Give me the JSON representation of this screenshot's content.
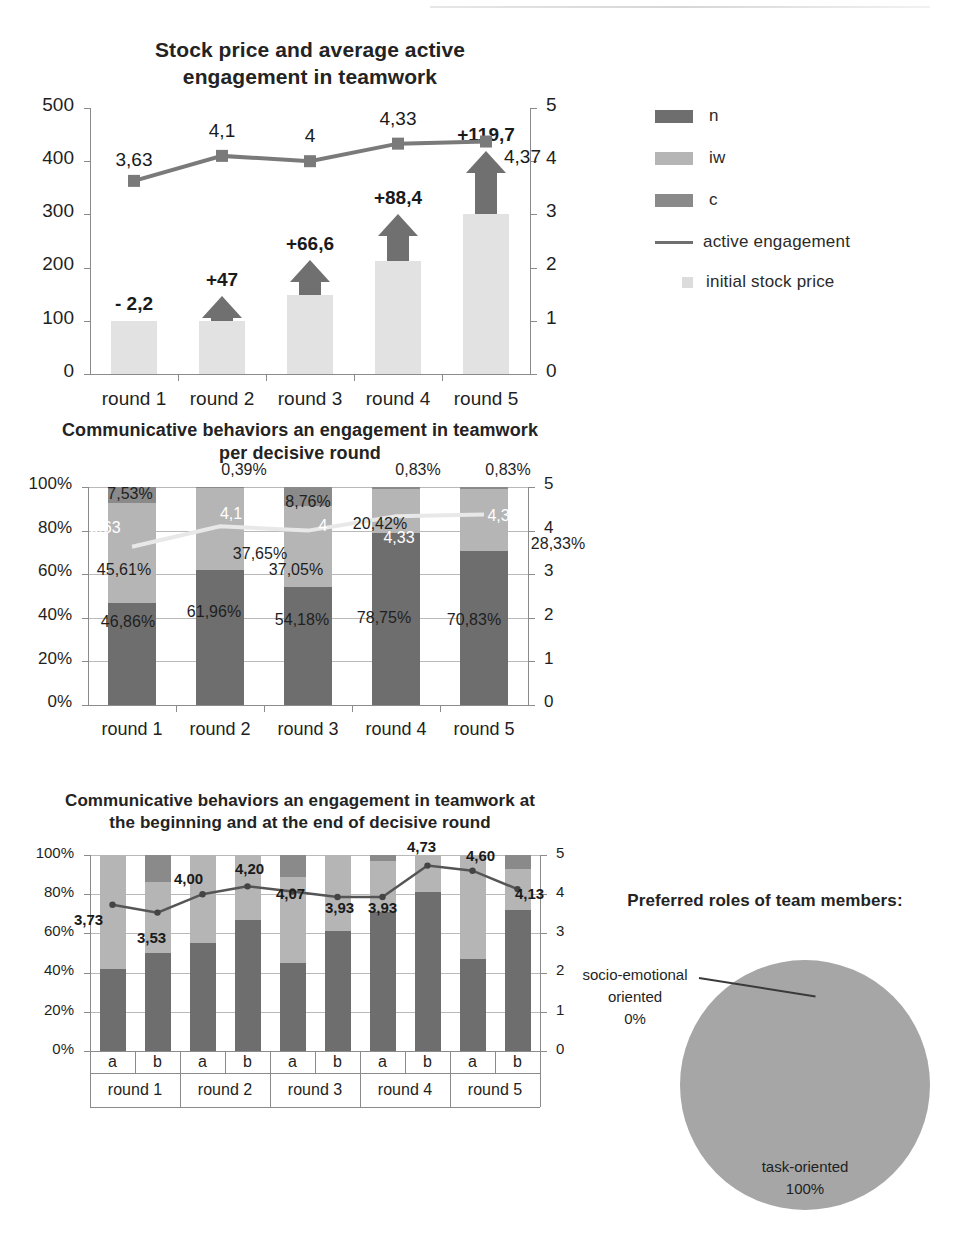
{
  "palette": {
    "dark": "#6e6e6e",
    "mid": "#9a9a9a",
    "light": "#d9d9d9",
    "line": "#7a7a7a",
    "line_light": "#e8e8e8",
    "axis": "#8b8b8b",
    "grid": "#b9b9b9",
    "pie": "#a6a6a6",
    "arrow": "#707070",
    "bar_initial": "#e2e2e2",
    "text": "#1f1f1f"
  },
  "legend": {
    "items": [
      {
        "label": "n",
        "type": "swatch",
        "color": "#6e6e6e"
      },
      {
        "label": "iw",
        "type": "swatch",
        "color": "#b5b5b5"
      },
      {
        "label": "c",
        "type": "swatch",
        "color": "#8a8a8a"
      },
      {
        "label": "active engagement",
        "type": "line",
        "color": "#6f6f6f"
      },
      {
        "label": "initial stock price",
        "type": "square",
        "color": "#dcdcdc"
      }
    ]
  },
  "chart_data": [
    {
      "id": "stock-price-chart",
      "type": "bar",
      "title": "Stock price and average active engagement in teamwork",
      "categories": [
        "round 1",
        "round 2",
        "round 3",
        "round 4",
        "round 5"
      ],
      "ylabel": "",
      "xlabel": "",
      "ylim": [
        0,
        500
      ],
      "yticks": [
        "0",
        "100",
        "200",
        "300",
        "400",
        "500"
      ],
      "y2lim": [
        0,
        5
      ],
      "y2ticks": [
        "0",
        "1",
        "2",
        "3",
        "4",
        "5"
      ],
      "grid": false,
      "legend_position": "right",
      "series": [
        {
          "name": "initial stock price",
          "values": [
            100,
            100,
            148,
            212,
            300
          ]
        },
        {
          "name": "change",
          "labels": [
            "- 2,2",
            "+47",
            "+66,6",
            "+88,4",
            "+119,7"
          ],
          "values": [
            -2.2,
            47,
            66.6,
            88.4,
            119.7
          ]
        },
        {
          "name": "active engagement",
          "values": [
            3.63,
            4.1,
            4.0,
            4.33,
            4.37
          ],
          "labels": [
            "3,63",
            "4,1",
            "4",
            "4,33",
            "4,37"
          ]
        }
      ]
    },
    {
      "id": "communicative-behaviors-per-round-chart",
      "type": "bar",
      "title": "Communicative behaviors an engagement in teamwork per decisive round",
      "categories": [
        "round 1",
        "round 2",
        "round 3",
        "round 4",
        "round 5"
      ],
      "ylim": [
        0,
        100
      ],
      "yticks": [
        "0%",
        "20%",
        "40%",
        "60%",
        "80%",
        "100%"
      ],
      "y2lim": [
        0,
        5
      ],
      "y2ticks": [
        "0",
        "1",
        "2",
        "3",
        "4",
        "5"
      ],
      "grid": true,
      "stacked": true,
      "series": [
        {
          "name": "n",
          "values": [
            46.86,
            61.96,
            54.18,
            78.75,
            70.83
          ],
          "labels": [
            "46,86%",
            "61,96%",
            "54,18%",
            "78,75%",
            "70,83%"
          ]
        },
        {
          "name": "iw",
          "values": [
            45.61,
            37.65,
            37.05,
            20.42,
            28.33
          ],
          "labels": [
            "45,61%",
            "37,65%",
            "37,05%",
            "20,42%",
            "28,33%"
          ]
        },
        {
          "name": "c",
          "values": [
            7.53,
            0.39,
            8.76,
            0.83,
            0.83
          ],
          "labels": [
            "7,53%",
            "0,39%",
            "8,76%",
            "0,83%",
            "0,83%"
          ]
        },
        {
          "name": "active engagement",
          "values": [
            3.63,
            4.1,
            4.0,
            4.33,
            4.37
          ],
          "labels": [
            "3,63",
            "4,1",
            "4",
            "4,33",
            "4,37"
          ]
        }
      ]
    },
    {
      "id": "communicative-behaviors-begin-end-chart",
      "type": "bar",
      "title": "Communicative behaviors an engagement in teamwork at the beginning and at the end of decisive round",
      "categories": [
        "a",
        "b",
        "a",
        "b",
        "a",
        "b",
        "a",
        "b",
        "a",
        "b"
      ],
      "groups": [
        "round 1",
        "round 2",
        "round 3",
        "round 4",
        "round 5"
      ],
      "ylim": [
        0,
        100
      ],
      "yticks": [
        "0%",
        "20%",
        "40%",
        "60%",
        "80%",
        "100%"
      ],
      "y2lim": [
        0,
        5
      ],
      "y2ticks": [
        "0",
        "1",
        "2",
        "3",
        "4",
        "5"
      ],
      "grid": true,
      "stacked": true,
      "series": [
        {
          "name": "n",
          "values": [
            42,
            50,
            55,
            67,
            45,
            61,
            71,
            81,
            47,
            72
          ]
        },
        {
          "name": "iw",
          "values": [
            58,
            36,
            45,
            33,
            44,
            39,
            26,
            19,
            53,
            21
          ]
        },
        {
          "name": "c",
          "values": [
            0,
            14,
            0,
            0,
            11,
            0,
            3,
            0,
            0,
            7
          ]
        },
        {
          "name": "active engagement",
          "values": [
            3.73,
            3.53,
            4.0,
            4.2,
            4.07,
            3.93,
            3.93,
            4.73,
            4.6,
            4.13
          ],
          "labels": [
            "3,73",
            "3,53",
            "4,00",
            "4,20",
            "4,07",
            "3,93",
            "3,93",
            "4,73",
            "4,60",
            "4,13"
          ]
        }
      ]
    },
    {
      "id": "preferred-roles-pie-chart",
      "type": "pie",
      "title": "Preferred roles of team members:",
      "slices": [
        {
          "label": "task-oriented",
          "value": 100,
          "label_text": "task-oriented",
          "pct_text": "100%"
        },
        {
          "label": "socio-emotional oriented",
          "value": 0,
          "label_line1": "socio-emotional",
          "label_line2": "oriented",
          "pct_text": "0%"
        }
      ]
    }
  ]
}
